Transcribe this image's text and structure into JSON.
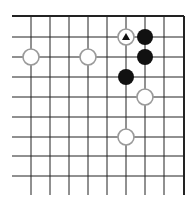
{
  "board": {
    "cols_x": [
      12,
      31,
      50,
      69,
      88,
      107,
      126,
      145,
      164,
      184
    ],
    "rows_y": [
      16,
      37,
      57,
      77,
      97,
      117,
      137,
      156,
      176
    ],
    "line_bottom": 195,
    "line_color": "#222222",
    "edge_top": true,
    "edge_right": true,
    "stone_radius": 8
  },
  "stones": [
    {
      "color": "white",
      "col": 6,
      "row": 1,
      "marker": "triangle"
    },
    {
      "color": "black",
      "col": 7,
      "row": 1
    },
    {
      "color": "black",
      "col": 7,
      "row": 2
    },
    {
      "color": "white",
      "col": 1,
      "row": 2
    },
    {
      "color": "white",
      "col": 4,
      "row": 2
    },
    {
      "color": "black",
      "col": 6,
      "row": 3
    },
    {
      "color": "white",
      "col": 7,
      "row": 4
    },
    {
      "color": "white",
      "col": 6,
      "row": 6
    }
  ]
}
